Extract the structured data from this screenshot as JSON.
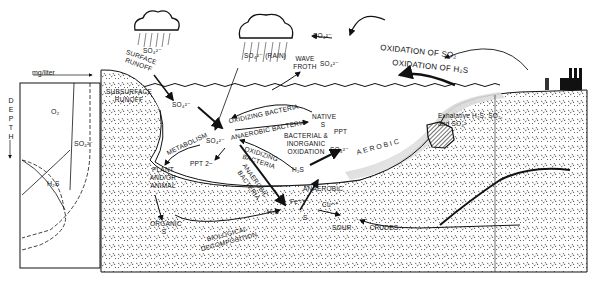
{
  "figure": {
    "type": "sulfur-cycle-cross-section",
    "caption_partial": "Figure 13.2 Sulfur cycle"
  },
  "depth_profile": {
    "axis_label_top": "mg/liter",
    "axis_label_side": "DEPTH",
    "curves": [
      "O₂",
      "SO₄²⁻",
      "H₂S"
    ]
  },
  "atmosphere": {
    "cloud_left_label": "SO₄²⁻",
    "cloud_center_label": "SO₄²⁻ (RAIN)",
    "so4_top": "SO₄²⁻",
    "wave_froth": "WAVE FROTH",
    "wave_so4": "SO₄²⁻",
    "oxidation_so2": "OXIDATION OF SO₂",
    "oxidation_h2s": "OXIDATION OF H₂S"
  },
  "processes": {
    "surface_runoff": "SURFACE RUNOFF",
    "subsurface_runoff": "SUBSURFACE RUNOFF",
    "runoff_so4": "SO₄²⁻",
    "central_so4": "SO₄²⁻",
    "oxidizing_bacteria_top": "OXIDIZING BACTERIA",
    "anaerobic_bacteria_top": "ANAEROBIC BACTERIA",
    "native_s": "NATIVE S",
    "ppt_right": "PPT",
    "bacterial_inorganic": "BACTERIAL & INORGANIC OXIDATION",
    "so4_right": "SO₄²⁻",
    "aerobic": "AEROBIC",
    "metabolism": "METABOLISM",
    "ppt_2minus": "PPT 2−",
    "oxidizing_bacteria_mid": "OXIDIZING BACTERIA",
    "anaerobic_bacteria_diag": "ANAEROBIC BACTERIA",
    "h2s_mid": "H₂S",
    "plant_animal": "PLANT AND/OR ANIMAL",
    "anaerobic_zone": "ANAEROBIC",
    "organic_s": "ORGANIC S",
    "biological_decomposition": "BIOLOGICAL DECOMPOSITION",
    "h2s_low": "H₂S",
    "fe": "Fe⁺⁺",
    "cu": "Cu⁺⁺",
    "s_low": "S",
    "sour_crudes": "SOUR CRUDES",
    "exhalative": "Exhalative H₂S, SO₂, and SO₄²"
  }
}
